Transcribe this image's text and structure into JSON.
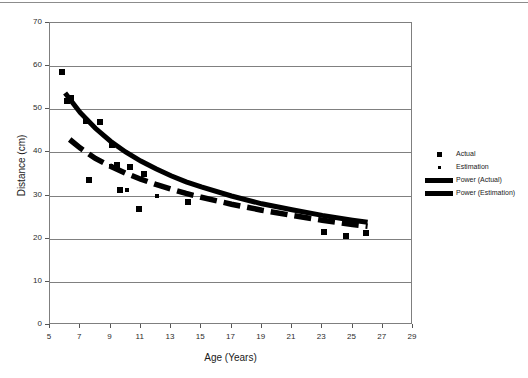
{
  "chart_data": {
    "type": "scatter",
    "title": "",
    "xlabel": "Age (Years)",
    "ylabel": "Distance (cm)",
    "xlim": [
      5,
      29
    ],
    "ylim": [
      0,
      70
    ],
    "xticks": [
      5,
      7,
      9,
      11,
      13,
      15,
      17,
      19,
      21,
      23,
      25,
      27,
      29
    ],
    "yticks": [
      0,
      10,
      20,
      30,
      40,
      50,
      60,
      70
    ],
    "grid": "horizontal",
    "legend_position": "right",
    "legend": [
      {
        "label": "Actual",
        "marker": "square-large",
        "color": "#000000"
      },
      {
        "label": "Estimation",
        "marker": "square-small",
        "color": "#000000"
      },
      {
        "label": "Power (Actual)",
        "marker": "thick-line",
        "color": "#000000"
      },
      {
        "label": "Power (Estimation)",
        "marker": "thick-dashed-line",
        "color": "#000000"
      }
    ],
    "series": [
      {
        "name": "Actual",
        "type": "scatter",
        "marker": "square-large",
        "points": [
          {
            "x": 5.8,
            "y": 58.6
          },
          {
            "x": 6.1,
            "y": 52.0
          },
          {
            "x": 6.4,
            "y": 52.6
          },
          {
            "x": 7.4,
            "y": 47.4
          },
          {
            "x": 8.3,
            "y": 47.0
          },
          {
            "x": 9.1,
            "y": 41.7
          },
          {
            "x": 7.6,
            "y": 33.7
          },
          {
            "x": 9.4,
            "y": 37.0
          },
          {
            "x": 10.3,
            "y": 36.6
          },
          {
            "x": 9.6,
            "y": 31.2
          },
          {
            "x": 11.2,
            "y": 35.1
          },
          {
            "x": 10.9,
            "y": 26.9
          },
          {
            "x": 14.1,
            "y": 28.6
          },
          {
            "x": 23.1,
            "y": 21.6
          },
          {
            "x": 24.6,
            "y": 20.6
          },
          {
            "x": 25.9,
            "y": 21.3
          }
        ]
      },
      {
        "name": "Estimation",
        "type": "scatter",
        "marker": "square-small",
        "points": [
          {
            "x": 9.0,
            "y": 36.8
          },
          {
            "x": 10.1,
            "y": 31.4
          },
          {
            "x": 12.1,
            "y": 29.8
          }
        ]
      },
      {
        "name": "Power (Actual)",
        "type": "power-trendline",
        "style": "solid-thick",
        "curve": [
          {
            "x": 6.0,
            "y": 53.8
          },
          {
            "x": 7.0,
            "y": 49.2
          },
          {
            "x": 8.0,
            "y": 45.6
          },
          {
            "x": 9.0,
            "y": 42.6
          },
          {
            "x": 10.0,
            "y": 40.1
          },
          {
            "x": 11.0,
            "y": 38.0
          },
          {
            "x": 12.0,
            "y": 36.2
          },
          {
            "x": 13.0,
            "y": 34.6
          },
          {
            "x": 14.0,
            "y": 33.2
          },
          {
            "x": 15.0,
            "y": 32.0
          },
          {
            "x": 17.0,
            "y": 29.9
          },
          {
            "x": 19.0,
            "y": 28.1
          },
          {
            "x": 21.0,
            "y": 26.7
          },
          {
            "x": 23.0,
            "y": 25.4
          },
          {
            "x": 25.0,
            "y": 24.3
          },
          {
            "x": 26.0,
            "y": 23.8
          }
        ]
      },
      {
        "name": "Power (Estimation)",
        "type": "power-trendline",
        "style": "dashed-thick",
        "curve": [
          {
            "x": 6.3,
            "y": 43.0
          },
          {
            "x": 7.0,
            "y": 41.0
          },
          {
            "x": 8.0,
            "y": 38.6
          },
          {
            "x": 9.0,
            "y": 36.8
          },
          {
            "x": 10.0,
            "y": 35.2
          },
          {
            "x": 11.0,
            "y": 33.8
          },
          {
            "x": 12.0,
            "y": 32.6
          },
          {
            "x": 13.0,
            "y": 31.5
          },
          {
            "x": 14.0,
            "y": 30.5
          },
          {
            "x": 15.0,
            "y": 29.6
          },
          {
            "x": 17.0,
            "y": 28.0
          },
          {
            "x": 19.0,
            "y": 26.6
          },
          {
            "x": 21.0,
            "y": 25.4
          },
          {
            "x": 23.0,
            "y": 24.3
          },
          {
            "x": 25.0,
            "y": 23.3
          },
          {
            "x": 26.0,
            "y": 22.9
          }
        ]
      }
    ]
  }
}
